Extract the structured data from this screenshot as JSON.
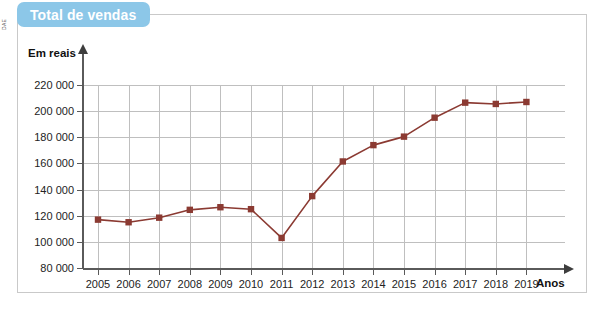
{
  "figure": {
    "title": "Total de vendas",
    "credit": "DAE",
    "accent_color": "#8cc7e8",
    "series_color": "#8b3a32",
    "grid_color": "#bfbfbf",
    "axis_color": "#5a5a5a"
  },
  "chart_data": {
    "type": "line",
    "title": "Total de vendas",
    "xlabel": "Anos",
    "ylabel": "Em reais",
    "categories": [
      "2005",
      "2006",
      "2007",
      "2008",
      "2009",
      "2010",
      "2011",
      "2012",
      "2013",
      "2014",
      "2015",
      "2016",
      "2017",
      "2018",
      "2019"
    ],
    "values": [
      117000,
      115000,
      118500,
      124500,
      126500,
      125000,
      103000,
      135000,
      161500,
      174000,
      180500,
      195000,
      206500,
      205500,
      207000
    ],
    "ylim": [
      80000,
      220000
    ],
    "ytick_step": 20000,
    "ytick_labels": [
      "220 000",
      "200 000",
      "180 000",
      "160 000",
      "140 000",
      "120 000",
      "100 000",
      "80 000"
    ],
    "ytick_values": [
      220000,
      200000,
      180000,
      160000,
      140000,
      120000,
      100000,
      80000
    ],
    "grid": true,
    "legend": false,
    "marker": "square",
    "series_name": "Total de vendas"
  }
}
